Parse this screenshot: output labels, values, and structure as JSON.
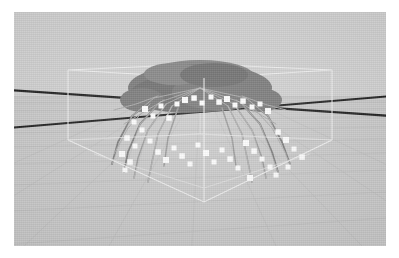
{
  "app": {
    "title": "3D Viewport",
    "view_label": "perspective"
  },
  "viewport": {
    "background_color": "#d2d2d2",
    "ground_color": "#cccccc",
    "grid_color": "#c2c2c2",
    "axis_color": "#1d1d1d",
    "bbox_color": "#f2f2f2",
    "joint_color": "#ffffff",
    "mesh_color": "#7a7a7a",
    "bone_color": "#bdbdbd"
  },
  "scene": {
    "object_name": "spider",
    "object_type": "articulated mesh with skeleton",
    "joint_count": 46,
    "leg_count": 8,
    "bounding_box_visible": true,
    "grid_visible": true,
    "axes_visible": true
  },
  "chart_data": {
    "type": "scatter",
    "title": "",
    "xlabel": "",
    "ylabel": "",
    "note": "3D joint markers projected to screen space within viewport",
    "joints": [
      {
        "x": 131,
        "y": 97
      },
      {
        "x": 139,
        "y": 104
      },
      {
        "x": 147,
        "y": 94
      },
      {
        "x": 155,
        "y": 106
      },
      {
        "x": 163,
        "y": 92
      },
      {
        "x": 171,
        "y": 88
      },
      {
        "x": 180,
        "y": 86
      },
      {
        "x": 188,
        "y": 91
      },
      {
        "x": 197,
        "y": 85
      },
      {
        "x": 205,
        "y": 90
      },
      {
        "x": 213,
        "y": 87
      },
      {
        "x": 221,
        "y": 93
      },
      {
        "x": 229,
        "y": 89
      },
      {
        "x": 238,
        "y": 95
      },
      {
        "x": 246,
        "y": 92
      },
      {
        "x": 254,
        "y": 99
      },
      {
        "x": 120,
        "y": 110
      },
      {
        "x": 128,
        "y": 118
      },
      {
        "x": 113,
        "y": 126
      },
      {
        "x": 121,
        "y": 134
      },
      {
        "x": 108,
        "y": 142
      },
      {
        "x": 116,
        "y": 150
      },
      {
        "x": 111,
        "y": 158
      },
      {
        "x": 136,
        "y": 129
      },
      {
        "x": 144,
        "y": 140
      },
      {
        "x": 152,
        "y": 148
      },
      {
        "x": 160,
        "y": 136
      },
      {
        "x": 168,
        "y": 144
      },
      {
        "x": 176,
        "y": 152
      },
      {
        "x": 184,
        "y": 133
      },
      {
        "x": 192,
        "y": 141
      },
      {
        "x": 200,
        "y": 150
      },
      {
        "x": 208,
        "y": 138
      },
      {
        "x": 216,
        "y": 147
      },
      {
        "x": 224,
        "y": 156
      },
      {
        "x": 232,
        "y": 131
      },
      {
        "x": 240,
        "y": 139
      },
      {
        "x": 248,
        "y": 147
      },
      {
        "x": 256,
        "y": 155
      },
      {
        "x": 264,
        "y": 120
      },
      {
        "x": 272,
        "y": 128
      },
      {
        "x": 280,
        "y": 137
      },
      {
        "x": 288,
        "y": 145
      },
      {
        "x": 274,
        "y": 155
      },
      {
        "x": 262,
        "y": 163
      },
      {
        "x": 236,
        "y": 166
      }
    ]
  }
}
